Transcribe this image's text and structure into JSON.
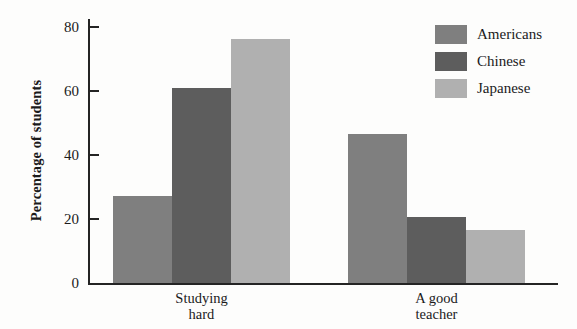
{
  "chart_data": {
    "type": "bar",
    "title": "",
    "xlabel": "",
    "ylabel": "Percentage of students",
    "categories": [
      "Studying\nhard",
      "A good\nteacher"
    ],
    "series": [
      {
        "name": "Americans",
        "color": "#7f7f7f",
        "values": [
          27,
          46.5
        ]
      },
      {
        "name": "Chinese",
        "color": "#5d5d5d",
        "values": [
          61,
          20.5
        ]
      },
      {
        "name": "Japanese",
        "color": "#b0b0b0",
        "values": [
          76,
          16.5
        ]
      }
    ],
    "ylim": [
      0,
      83
    ],
    "yticks": [
      0,
      20,
      40,
      60,
      80
    ],
    "ytick_labels": [
      "0",
      "20",
      "40",
      "60",
      "80"
    ],
    "grid": false,
    "legend_position": "top-right",
    "axis_color": "#242424",
    "background": "#fdfdfc"
  }
}
